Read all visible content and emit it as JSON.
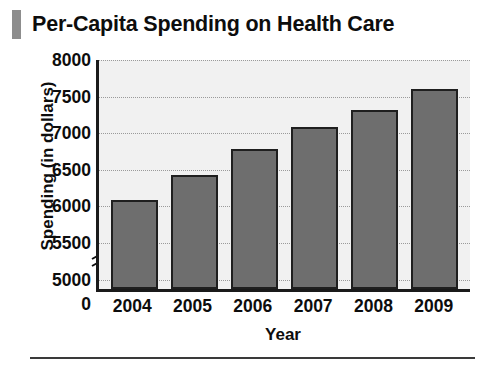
{
  "title": {
    "text": "Per-Capita Spending on Health Care",
    "accent_color": "#8d8d8d"
  },
  "chart_data": {
    "type": "bar",
    "title": "Per-Capita Spending on Health Care",
    "xlabel": "Year",
    "ylabel": "Spending (in dollars)",
    "categories": [
      "2004",
      "2005",
      "2006",
      "2007",
      "2008",
      "2009"
    ],
    "values": [
      6050,
      6390,
      6740,
      7040,
      7280,
      7560
    ],
    "ytick_labels": [
      "8000",
      "7500",
      "7000",
      "6500",
      "6000",
      "5500",
      "5000",
      "0"
    ],
    "ytick_values": [
      8000,
      7500,
      7000,
      6500,
      6000,
      5500,
      5000,
      0
    ],
    "ylim": [
      4830,
      8000
    ],
    "axis_break": true,
    "axis_break_glyph": "≈",
    "grid": true,
    "legend": "none",
    "bar_color": "#6e6e6e",
    "bar_edge_color": "#1f1f1f",
    "plot_background": "#f1f1f1",
    "axis_color": "#1a1a1a",
    "gridline_color": "#9a9a9a"
  }
}
